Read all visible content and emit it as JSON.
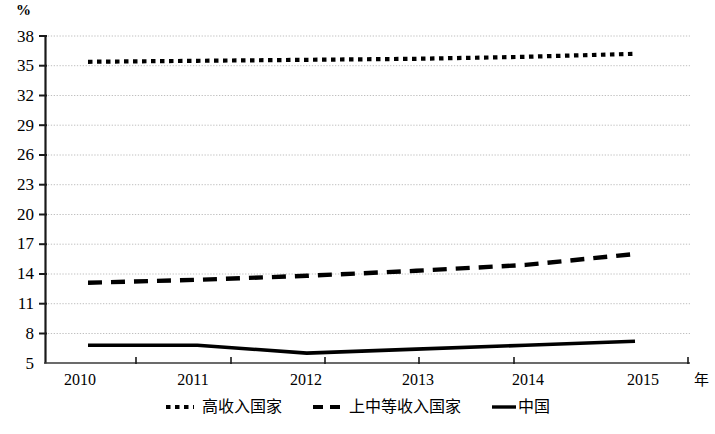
{
  "chart_data": {
    "type": "line",
    "title": "",
    "subtitle": "",
    "xlabel": "年",
    "ylabel": "%",
    "x": [
      2010,
      2011,
      2012,
      2013,
      2014,
      2015
    ],
    "categories": [
      "2010",
      "2011",
      "2012",
      "2013",
      "2014",
      "2015"
    ],
    "xlim": [
      2010,
      2015
    ],
    "ylim": [
      5,
      38
    ],
    "y_ticks": [
      38,
      35,
      32,
      29,
      26,
      23,
      20,
      17,
      14,
      11,
      8,
      5
    ],
    "grid": "horizontal-dotted",
    "legend_position": "bottom-center",
    "series": [
      {
        "name": "高收入国家",
        "style": "dotted",
        "color": "#000000",
        "values": [
          35.4,
          35.5,
          35.6,
          35.7,
          35.9,
          36.2
        ]
      },
      {
        "name": "上中等收入国家",
        "style": "dashed",
        "color": "#000000",
        "values": [
          13.1,
          13.4,
          13.8,
          14.3,
          14.9,
          16.0
        ]
      },
      {
        "name": "中国",
        "style": "solid",
        "color": "#000000",
        "values": [
          6.8,
          6.8,
          6.0,
          6.4,
          6.8,
          7.2
        ]
      }
    ]
  },
  "axis": {
    "y_unit": "%",
    "x_name": "年",
    "y_tick_labels": [
      "38",
      "35",
      "32",
      "29",
      "26",
      "23",
      "20",
      "17",
      "14",
      "11",
      "8",
      "5"
    ],
    "x_tick_labels": [
      "2010",
      "2011",
      "2012",
      "2013",
      "2014",
      "2015"
    ]
  },
  "legend": {
    "items": [
      {
        "label": "高收入国家",
        "marker": "dotted-line-swatch"
      },
      {
        "label": "上中等收入国家",
        "marker": "dashed-line-swatch"
      },
      {
        "label": "中国",
        "marker": "solid-line-swatch"
      }
    ]
  }
}
